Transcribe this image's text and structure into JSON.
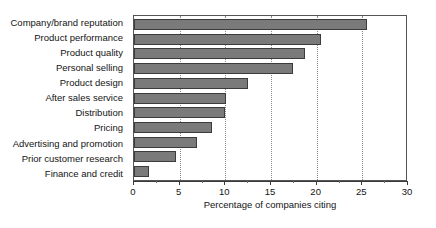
{
  "chart_data": {
    "type": "bar",
    "orientation": "horizontal",
    "title": "",
    "xlabel": "Percentage of companies citing",
    "ylabel": "",
    "xlim": [
      0,
      30
    ],
    "xticks": [
      0,
      5,
      10,
      15,
      20,
      25,
      30
    ],
    "xticklabels": [
      "0",
      "5",
      "10",
      "15",
      "20",
      "25",
      "30"
    ],
    "grid": "vertical-dotted",
    "legend": "none",
    "categories": [
      "Company/brand reputation",
      "Product performance",
      "Product quality",
      "Personal selling",
      "Product design",
      "After sales service",
      "Distribution",
      "Pricing",
      "Advertising and promotion",
      "Prior customer research",
      "Finance and credit"
    ],
    "values": [
      25.5,
      20.5,
      18.7,
      17.4,
      12.5,
      10.1,
      10.0,
      8.5,
      6.9,
      4.6,
      1.6
    ],
    "colors": {
      "bar_fill": "#7a7a7a",
      "bar_edge": "#3c3c3c",
      "axis": "#3a3a3a",
      "grid": "#8a8a8a",
      "frame": "#555555",
      "text": "#141414",
      "background": "#ffffff"
    }
  }
}
